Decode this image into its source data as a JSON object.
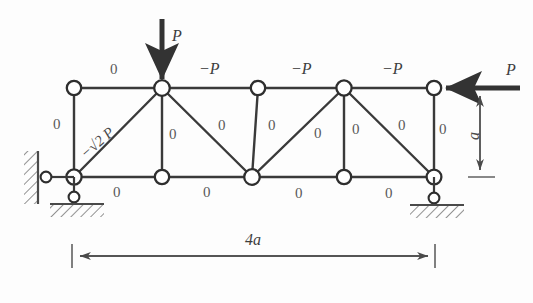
{
  "figure": {
    "colors": {
      "member_stroke": "#3a3a3a",
      "node_fill": "#ffffff",
      "node_stroke": "#2e2e2e",
      "label_text": "#4a4a4a",
      "background": "#fdfdfd",
      "hatch_stroke": "#4a4a4a"
    },
    "loads": [
      {
        "name": "top-vertical-load",
        "label": "P",
        "direction": "down",
        "at_node": "top-2"
      },
      {
        "name": "right-horizontal-load",
        "label": "P",
        "direction": "left",
        "at_node": "top-5"
      }
    ],
    "dimensions": [
      {
        "name": "span-dimension",
        "label": "4a",
        "orientation": "horizontal"
      },
      {
        "name": "height-dimension",
        "label": "a",
        "orientation": "vertical"
      }
    ],
    "member_labels": {
      "top_chord": [
        "0",
        "−P",
        "−P",
        "−P"
      ],
      "bottom_chord": [
        "0",
        "0",
        "0",
        "0"
      ],
      "verticals": [
        "0",
        "0",
        "0",
        "0",
        "0"
      ],
      "diagonals": [
        "−√2 P",
        "0",
        "0",
        "0"
      ]
    },
    "diagonal_first": {
      "label_prefix": "−",
      "label_radical": "√2",
      "label_suffix": "P",
      "label_full": "−√2 P"
    },
    "supports": [
      {
        "name": "left-support",
        "type": "pin-with-links"
      },
      {
        "name": "right-support",
        "type": "roller-link"
      }
    ],
    "nodes": {
      "top": [
        "top-1",
        "top-2",
        "top-3",
        "top-4",
        "top-5"
      ],
      "bottom": [
        "bot-1",
        "bot-2",
        "bot-3",
        "bot-4",
        "bot-5"
      ]
    }
  }
}
